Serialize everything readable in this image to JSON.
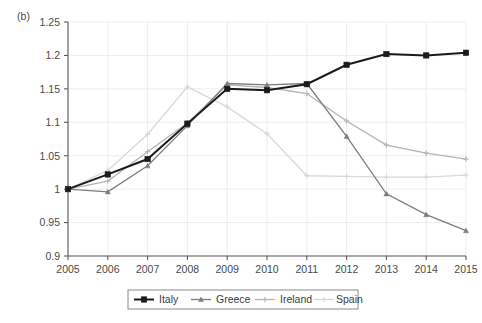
{
  "figure": {
    "panel_label": "(b)",
    "background_color": "#ffffff"
  },
  "chart_data": {
    "type": "line",
    "title": "",
    "xlabel": "",
    "ylabel": "",
    "x": [
      2005,
      2006,
      2007,
      2008,
      2009,
      2010,
      2011,
      2012,
      2013,
      2014,
      2015
    ],
    "categories": [
      "2005",
      "2006",
      "2007",
      "2008",
      "2009",
      "2010",
      "2011",
      "2012",
      "2013",
      "2014",
      "2015"
    ],
    "xlim": [
      2005,
      2015
    ],
    "ylim": [
      0.9,
      1.25
    ],
    "yticks": [
      0.9,
      0.95,
      1,
      1.05,
      1.1,
      1.15,
      1.2,
      1.25
    ],
    "ytick_labels": [
      "0.9",
      "0.95",
      "1",
      "1.05",
      "1.1",
      "1.15",
      "1.2",
      "1.25"
    ],
    "xticks": [
      2005,
      2006,
      2007,
      2008,
      2009,
      2010,
      2011,
      2012,
      2013,
      2014,
      2015
    ],
    "grid": true,
    "legend_position": "bottom",
    "series": [
      {
        "name": "Italy",
        "color": "#1a1a1a",
        "marker": "square",
        "values": [
          1.0,
          1.022,
          1.045,
          1.098,
          1.15,
          1.148,
          1.157,
          1.186,
          1.202,
          1.2,
          1.204
        ]
      },
      {
        "name": "Greece",
        "color": "#7d7d7d",
        "marker": "triangle",
        "values": [
          1.0,
          0.996,
          1.035,
          1.095,
          1.158,
          1.156,
          1.158,
          1.079,
          0.993,
          0.962,
          0.938
        ]
      },
      {
        "name": "Ireland",
        "color": "#b4b4b4",
        "marker": "plus",
        "values": [
          1.0,
          1.012,
          1.056,
          1.099,
          1.156,
          1.152,
          1.143,
          1.102,
          1.066,
          1.054,
          1.045
        ]
      },
      {
        "name": "Spain",
        "color": "#d8d8d8",
        "marker": "plus",
        "values": [
          1.0,
          1.028,
          1.082,
          1.153,
          1.123,
          1.083,
          1.02,
          1.019,
          1.018,
          1.018,
          1.021
        ]
      }
    ]
  },
  "legend": {
    "entries": [
      {
        "label": "Italy"
      },
      {
        "label": "Greece"
      },
      {
        "label": "Ireland"
      },
      {
        "label": "Spain"
      }
    ]
  }
}
